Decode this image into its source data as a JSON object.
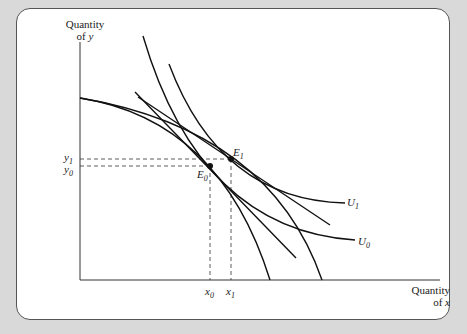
{
  "figure": {
    "y_axis_label": [
      "Quantity",
      "of y"
    ],
    "x_axis_label": [
      "Quantity",
      "of x"
    ],
    "y_ticks": [
      {
        "var": "y",
        "sub": "1"
      },
      {
        "var": "y",
        "sub": "0"
      }
    ],
    "x_ticks": [
      {
        "var": "x",
        "sub": "0"
      },
      {
        "var": "x",
        "sub": "1"
      }
    ],
    "points": [
      {
        "name": "E",
        "sub": "0"
      },
      {
        "name": "E",
        "sub": "1"
      }
    ],
    "curves": [
      {
        "name": "U",
        "sub": "1"
      },
      {
        "name": "U",
        "sub": "0"
      }
    ]
  }
}
